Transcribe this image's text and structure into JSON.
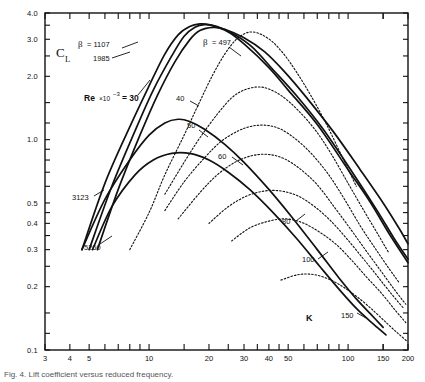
{
  "figure": {
    "caption": "Fig. 4. Lift coefficient versus reduced frequency."
  },
  "chart_data": {
    "type": "line",
    "title": "",
    "xlabel": "K",
    "ylabel": "C_L",
    "xscale": "log",
    "yscale": "log",
    "xlim": [
      3,
      200
    ],
    "ylim": [
      0.1,
      4.0
    ],
    "grid": false,
    "legend_position": "inline-curve-labels",
    "x_tick_labels": [
      "3",
      "4",
      "5",
      "10",
      "20",
      "30",
      "40",
      "50",
      "100",
      "150",
      "200"
    ],
    "x_tick_values": [
      3,
      4,
      5,
      10,
      20,
      30,
      40,
      50,
      100,
      150,
      200
    ],
    "x_minor_ticks": [
      6,
      7,
      8,
      9,
      15,
      25,
      35,
      45,
      60,
      70,
      80,
      90,
      150
    ],
    "y_tick_labels": [
      "4.0",
      "3.0",
      "2.0",
      "1.0",
      "0.5",
      "0.4",
      "0.3",
      "0.2",
      "0.1"
    ],
    "y_tick_values": [
      4.0,
      3.0,
      2.0,
      1.0,
      0.5,
      0.4,
      0.3,
      0.2,
      0.1
    ],
    "y_minor_ticks": [
      3.5,
      2.5,
      1.5,
      1.2,
      0.9,
      0.8,
      0.7,
      0.6,
      0.45,
      0.35,
      0.25,
      0.15,
      0.12
    ],
    "annotations": [
      {
        "text": "β = 1107",
        "x_px": 80,
        "y_px": 44
      },
      {
        "text": "1985",
        "x_px": 96,
        "y_px": 58
      },
      {
        "text": "β = 497",
        "x_px": 205,
        "y_px": 42
      },
      {
        "text": "3123",
        "x_px": 82,
        "y_px": 197
      },
      {
        "text": "5260",
        "x_px": 92,
        "y_px": 247
      },
      {
        "text": "Re ×10",
        "x_px": 112,
        "y_px": 98
      },
      {
        "text": "K",
        "x_px": 310,
        "y_px": 318
      }
    ],
    "series": [
      {
        "name": "beta = 1107",
        "style": "solid",
        "label": "β = 1107",
        "points": [
          [
            4.6,
            0.3
          ],
          [
            6,
            0.62
          ],
          [
            8,
            1.15
          ],
          [
            10,
            1.8
          ],
          [
            12,
            2.55
          ],
          [
            14,
            3.15
          ],
          [
            16,
            3.45
          ],
          [
            18,
            3.55
          ],
          [
            20,
            3.52
          ],
          [
            25,
            3.25
          ],
          [
            30,
            2.85
          ],
          [
            40,
            2.2
          ],
          [
            50,
            1.72
          ],
          [
            70,
            1.18
          ],
          [
            100,
            0.72
          ],
          [
            130,
            0.5
          ],
          [
            160,
            0.36
          ],
          [
            200,
            0.26
          ]
        ]
      },
      {
        "name": "beta = 1985",
        "style": "solid",
        "label": "1985",
        "points": [
          [
            5.0,
            0.3
          ],
          [
            6.5,
            0.6
          ],
          [
            8.5,
            1.1
          ],
          [
            10.5,
            1.72
          ],
          [
            13,
            2.5
          ],
          [
            15,
            3.1
          ],
          [
            17,
            3.42
          ],
          [
            19,
            3.52
          ],
          [
            22,
            3.45
          ],
          [
            27,
            3.15
          ],
          [
            33,
            2.75
          ],
          [
            42,
            2.15
          ],
          [
            55,
            1.62
          ],
          [
            75,
            1.12
          ],
          [
            105,
            0.7
          ],
          [
            140,
            0.46
          ],
          [
            170,
            0.34
          ],
          [
            200,
            0.27
          ]
        ]
      },
      {
        "name": "beta = 497",
        "style": "solid",
        "label": "β = 497",
        "points": [
          [
            5.5,
            0.3
          ],
          [
            7,
            0.58
          ],
          [
            9,
            1.05
          ],
          [
            11,
            1.62
          ],
          [
            13.5,
            2.35
          ],
          [
            16,
            2.98
          ],
          [
            18,
            3.3
          ],
          [
            21,
            3.42
          ],
          [
            24,
            3.35
          ],
          [
            30,
            3.05
          ],
          [
            38,
            2.62
          ],
          [
            48,
            2.1
          ],
          [
            62,
            1.58
          ],
          [
            85,
            1.08
          ],
          [
            115,
            0.72
          ],
          [
            150,
            0.5
          ],
          [
            180,
            0.38
          ],
          [
            200,
            0.32
          ]
        ]
      },
      {
        "name": "3123",
        "style": "solid",
        "label": "3123",
        "points": [
          [
            4.6,
            0.3
          ],
          [
            6,
            0.52
          ],
          [
            8,
            0.8
          ],
          [
            10,
            1.05
          ],
          [
            12,
            1.2
          ],
          [
            14,
            1.25
          ],
          [
            16,
            1.22
          ],
          [
            19,
            1.12
          ],
          [
            24,
            0.95
          ],
          [
            30,
            0.78
          ],
          [
            40,
            0.58
          ],
          [
            52,
            0.43
          ],
          [
            70,
            0.3
          ],
          [
            90,
            0.22
          ],
          [
            110,
            0.175
          ],
          [
            130,
            0.148
          ],
          [
            150,
            0.128
          ]
        ]
      },
      {
        "name": "5260",
        "style": "solid",
        "label": "5260",
        "points": [
          [
            5.2,
            0.3
          ],
          [
            6.5,
            0.48
          ],
          [
            8.5,
            0.68
          ],
          [
            10.5,
            0.8
          ],
          [
            13,
            0.86
          ],
          [
            16,
            0.86
          ],
          [
            20,
            0.8
          ],
          [
            25,
            0.7
          ],
          [
            32,
            0.58
          ],
          [
            42,
            0.45
          ],
          [
            55,
            0.34
          ],
          [
            72,
            0.25
          ],
          [
            92,
            0.19
          ],
          [
            112,
            0.155
          ],
          [
            135,
            0.132
          ],
          [
            155,
            0.118
          ]
        ]
      },
      {
        "name": "Re x10^-3 = 30",
        "style": "dotted",
        "label": "30",
        "points": [
          [
            8,
            0.3
          ],
          [
            10,
            0.45
          ],
          [
            12,
            0.68
          ],
          [
            15,
            1.05
          ],
          [
            18,
            1.52
          ],
          [
            21,
            2.05
          ],
          [
            24,
            2.55
          ],
          [
            27,
            2.95
          ],
          [
            30,
            3.18
          ],
          [
            33,
            3.25
          ],
          [
            37,
            3.15
          ],
          [
            42,
            2.9
          ],
          [
            48,
            2.52
          ],
          [
            55,
            2.1
          ],
          [
            65,
            1.62
          ],
          [
            78,
            1.18
          ],
          [
            95,
            0.8
          ],
          [
            110,
            0.6
          ]
        ]
      },
      {
        "name": "Re x10^-3 = 40",
        "style": "dotted",
        "label": "40",
        "points": [
          [
            12,
            0.55
          ],
          [
            15,
            0.78
          ],
          [
            18,
            1.02
          ],
          [
            22,
            1.32
          ],
          [
            26,
            1.58
          ],
          [
            30,
            1.72
          ],
          [
            35,
            1.78
          ],
          [
            40,
            1.74
          ],
          [
            47,
            1.6
          ],
          [
            56,
            1.38
          ],
          [
            68,
            1.12
          ],
          [
            82,
            0.86
          ],
          [
            100,
            0.62
          ],
          [
            120,
            0.46
          ],
          [
            140,
            0.36
          ],
          [
            160,
            0.29
          ]
        ]
      },
      {
        "name": "Re x10^-3 = 50",
        "style": "dotted",
        "label": "50",
        "points": [
          [
            12,
            0.46
          ],
          [
            15,
            0.63
          ],
          [
            19,
            0.82
          ],
          [
            23,
            0.98
          ],
          [
            28,
            1.1
          ],
          [
            33,
            1.16
          ],
          [
            39,
            1.17
          ],
          [
            46,
            1.12
          ],
          [
            55,
            1.0
          ],
          [
            66,
            0.85
          ],
          [
            80,
            0.68
          ],
          [
            96,
            0.52
          ],
          [
            115,
            0.39
          ],
          [
            135,
            0.31
          ],
          [
            160,
            0.245
          ],
          [
            180,
            0.21
          ]
        ]
      },
      {
        "name": "Re x10^-3 = 60",
        "style": "dotted",
        "label": "60",
        "points": [
          [
            14,
            0.42
          ],
          [
            18,
            0.56
          ],
          [
            22,
            0.68
          ],
          [
            27,
            0.78
          ],
          [
            33,
            0.84
          ],
          [
            40,
            0.85
          ],
          [
            48,
            0.81
          ],
          [
            58,
            0.72
          ],
          [
            70,
            0.61
          ],
          [
            85,
            0.48
          ],
          [
            102,
            0.38
          ],
          [
            122,
            0.3
          ],
          [
            145,
            0.24
          ],
          [
            170,
            0.195
          ],
          [
            195,
            0.165
          ]
        ]
      },
      {
        "name": "Re x10^-3 = 80",
        "style": "dotted",
        "label": "80",
        "points": [
          [
            20,
            0.4
          ],
          [
            25,
            0.48
          ],
          [
            31,
            0.54
          ],
          [
            38,
            0.57
          ],
          [
            46,
            0.57
          ],
          [
            56,
            0.54
          ],
          [
            68,
            0.48
          ],
          [
            82,
            0.41
          ],
          [
            98,
            0.34
          ],
          [
            118,
            0.275
          ],
          [
            140,
            0.225
          ],
          [
            165,
            0.185
          ],
          [
            190,
            0.158
          ]
        ]
      },
      {
        "name": "Re x10^-3 = 100",
        "style": "dotted",
        "label": "100",
        "points": [
          [
            26,
            0.33
          ],
          [
            32,
            0.38
          ],
          [
            40,
            0.41
          ],
          [
            49,
            0.42
          ],
          [
            60,
            0.4
          ],
          [
            73,
            0.36
          ],
          [
            88,
            0.315
          ],
          [
            105,
            0.265
          ],
          [
            125,
            0.22
          ],
          [
            148,
            0.185
          ],
          [
            172,
            0.155
          ],
          [
            195,
            0.135
          ]
        ]
      },
      {
        "name": "Re x10^-3 = 150",
        "style": "dotted",
        "label": "150",
        "points": [
          [
            46,
            0.215
          ],
          [
            56,
            0.228
          ],
          [
            68,
            0.228
          ],
          [
            82,
            0.215
          ],
          [
            98,
            0.195
          ],
          [
            117,
            0.172
          ],
          [
            138,
            0.15
          ],
          [
            158,
            0.133
          ],
          [
            178,
            0.12
          ],
          [
            198,
            0.11
          ]
        ]
      }
    ]
  }
}
